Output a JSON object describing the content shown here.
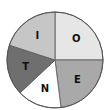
{
  "chart_data": {
    "type": "pie",
    "title": "",
    "start_angle": "12 o'clock",
    "direction": "clockwise",
    "slices": [
      {
        "label": "O",
        "value": 25,
        "color": "#e6e6e6"
      },
      {
        "label": "E",
        "value": 23,
        "color": "#a9a9a9"
      },
      {
        "label": "N",
        "value": 15,
        "color": "#ffffff"
      },
      {
        "label": "T",
        "value": 17,
        "color": "#6f6f6f"
      },
      {
        "label": "I",
        "value": 20,
        "color": "#c6c6c6"
      }
    ],
    "legend": "none"
  }
}
